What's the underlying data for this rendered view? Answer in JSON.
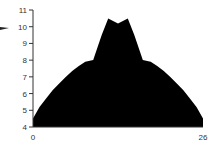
{
  "chart_data": {
    "type": "area",
    "title": "",
    "xlabel": "",
    "ylabel": "",
    "xlim": [
      0,
      26
    ],
    "ylim": [
      4,
      11
    ],
    "grid": false,
    "legend": null,
    "x_tick_labels": [
      "0",
      "26"
    ],
    "y_tick_labels": [
      "4",
      "5",
      "6",
      "7",
      "8",
      "9",
      "10",
      "11"
    ],
    "fill_color": "#000000",
    "series": [
      {
        "name": "area",
        "x": [
          0,
          1,
          2,
          3,
          4,
          5,
          6,
          7,
          8,
          9.2,
          10.5,
          11.5,
          13,
          14.5,
          15.5,
          16.8,
          18,
          19,
          20,
          21,
          22,
          23,
          24,
          25,
          26
        ],
        "y": [
          4.5,
          5.2,
          5.7,
          6.2,
          6.6,
          7.0,
          7.35,
          7.65,
          7.9,
          8.0,
          9.5,
          10.5,
          10.2,
          10.5,
          9.5,
          8.0,
          7.9,
          7.65,
          7.35,
          7.0,
          6.6,
          6.2,
          5.7,
          5.2,
          4.5
        ]
      }
    ],
    "annotations": [
      {
        "type": "arrow-fragment",
        "near_y": 10,
        "side": "left"
      }
    ]
  },
  "axes": {
    "x": {
      "min_label": "0",
      "max_label": "26"
    },
    "y": {
      "labels": [
        "4",
        "5",
        "6",
        "7",
        "8",
        "9",
        "10",
        "11"
      ]
    }
  }
}
